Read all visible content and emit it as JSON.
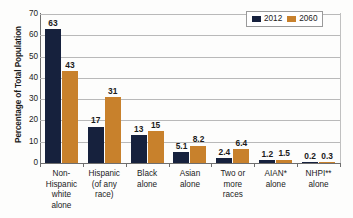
{
  "chart_data": {
    "type": "bar",
    "title": "",
    "xlabel": "",
    "ylabel": "Percentage of Total Population",
    "ylim": [
      0,
      70
    ],
    "yticks": [
      0,
      10,
      20,
      30,
      40,
      50,
      60,
      70
    ],
    "grid": true,
    "legend_position": "top-right",
    "categories": [
      "Non-\nHispanic\nwhite\nalone",
      "Hispanic\n(of any\nrace)",
      "Black\nalone",
      "Asian\nalone",
      "Two or\nmore\nraces",
      "AIAN*\nalone",
      "NHPI**\nalone"
    ],
    "series": [
      {
        "name": "2012",
        "color": "#16213d",
        "values": [
          63,
          17,
          13,
          5.1,
          2.4,
          1.2,
          0.2
        ],
        "labels": [
          "63",
          "17",
          "13",
          "5.1",
          "2.4",
          "1.2",
          "0.2"
        ]
      },
      {
        "name": "2060",
        "color": "#c8812c",
        "values": [
          43,
          31,
          15,
          8.2,
          6.4,
          1.5,
          0.3
        ],
        "labels": [
          "43",
          "31",
          "15",
          "8.2",
          "6.4",
          "1.5",
          "0.3"
        ]
      }
    ]
  },
  "legend": {
    "items": [
      {
        "label": "2012",
        "key": "s2012"
      },
      {
        "label": "2060",
        "key": "s2060"
      }
    ]
  }
}
